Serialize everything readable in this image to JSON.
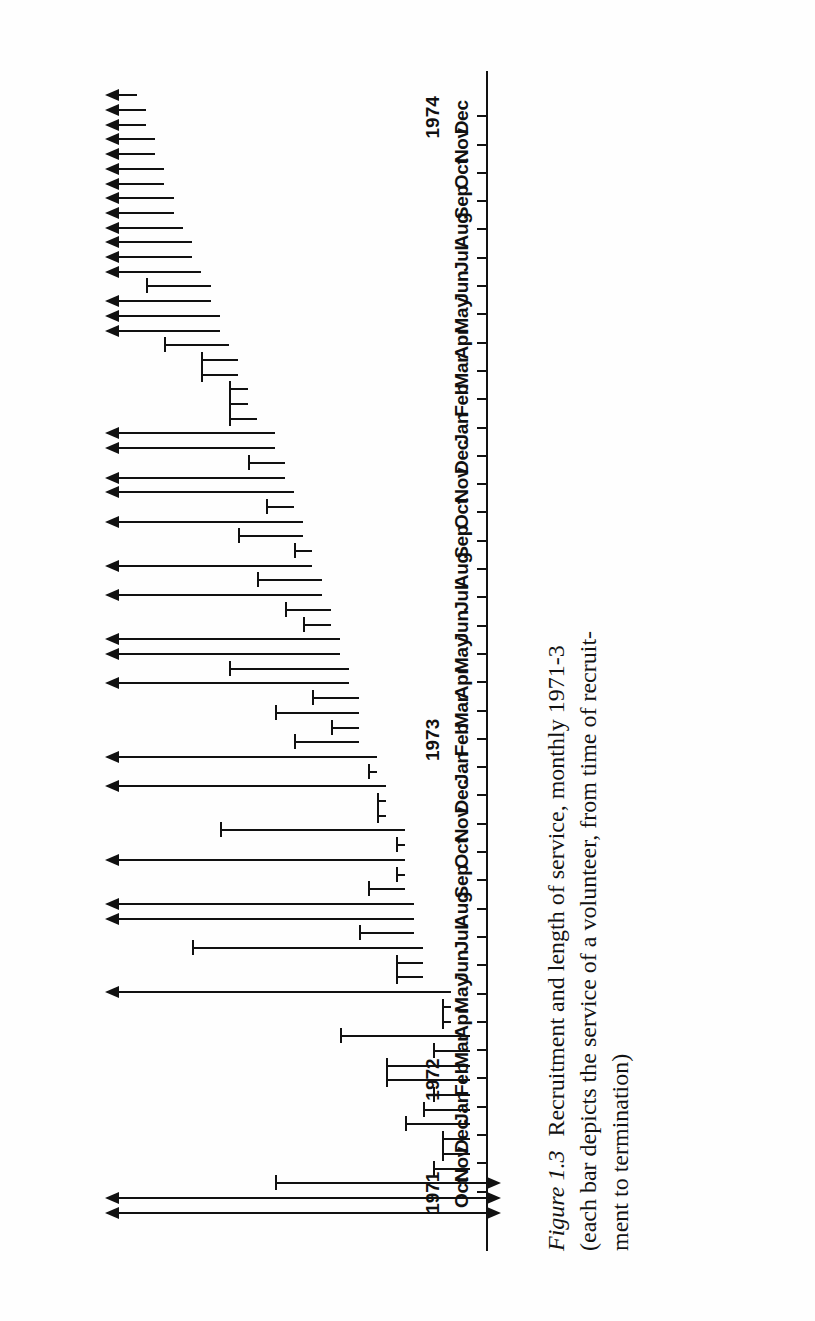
{
  "figure": {
    "caption_label": "Figure 1.3",
    "caption_line1": "Recruitment and length of service, monthly 1971-3",
    "caption_line2": "(each bar depicts the service of a volunteer, from time of recruit-",
    "caption_line3": "ment to termination)"
  },
  "chart_data": {
    "type": "bar",
    "title": "Recruitment and length of service, monthly 1971-3",
    "subtitle": "(each bar depicts the service of a volunteer, from time of recruitment to termination)",
    "orientation": "horizontal-time-axis-rotated",
    "xlabel": "",
    "ylabel": "",
    "grid": false,
    "legend": null,
    "axis_months": [
      "Oct",
      "Nov",
      "Dec",
      "Jan",
      "Feb",
      "Mar",
      "Apr",
      "May",
      "Jun",
      "Jul",
      "Aug",
      "Sep",
      "Oct",
      "Nov",
      "Dec",
      "Jan",
      "Feb",
      "Mar",
      "Apr",
      "May",
      "Jun",
      "Jul",
      "Aug",
      "Sep",
      "Oct",
      "Nov",
      "Dec",
      "Jan",
      "Feb",
      "Mar",
      "Apr",
      "May",
      "Jun",
      "Jul",
      "Aug",
      "Sep",
      "Oct",
      "Nov",
      "Dec"
    ],
    "axis_years": [
      {
        "label": "1971",
        "month_index": 0
      },
      {
        "label": "1972",
        "month_index": 4
      },
      {
        "label": "1973",
        "month_index": 16
      },
      {
        "label": "1974",
        "month_index": 38
      }
    ],
    "axis_range_months": [
      0,
      38
    ],
    "units": "months from Oct 1971",
    "censored_marker": "arrowhead",
    "terminated_marker": "cap-bar",
    "bars": [
      {
        "index": 1,
        "start": -1,
        "end": 39,
        "start_censored": true,
        "end_censored": true
      },
      {
        "index": 2,
        "start": -1,
        "end": 39,
        "start_censored": true,
        "end_censored": true
      },
      {
        "index": 3,
        "start": -1,
        "end": 22,
        "start_censored": true,
        "end_censored": false
      },
      {
        "index": 4,
        "start": 1,
        "end": 5,
        "start_censored": false,
        "end_censored": false
      },
      {
        "index": 5,
        "start": 1,
        "end": 4,
        "start_censored": false,
        "end_censored": false
      },
      {
        "index": 6,
        "start": 1,
        "end": 4,
        "start_censored": false,
        "end_censored": false
      },
      {
        "index": 7,
        "start": 1,
        "end": 8,
        "start_censored": false,
        "end_censored": false
      },
      {
        "index": 8,
        "start": 1,
        "end": 6,
        "start_censored": false,
        "end_censored": false
      },
      {
        "index": 9,
        "start": 1,
        "end": 5,
        "start_censored": false,
        "end_censored": false
      },
      {
        "index": 10,
        "start": 1,
        "end": 10,
        "start_censored": false,
        "end_censored": false
      },
      {
        "index": 11,
        "start": 1,
        "end": 10,
        "start_censored": false,
        "end_censored": false
      },
      {
        "index": 12,
        "start": 1,
        "end": 5,
        "start_censored": false,
        "end_censored": false
      },
      {
        "index": 13,
        "start": 1,
        "end": 15,
        "start_censored": false,
        "end_censored": false
      },
      {
        "index": 14,
        "start": 3,
        "end": 4,
        "start_censored": false,
        "end_censored": false
      },
      {
        "index": 15,
        "start": 3,
        "end": 4,
        "start_censored": false,
        "end_censored": false
      },
      {
        "index": 16,
        "start": 3,
        "end": 39,
        "start_censored": false,
        "end_censored": true
      },
      {
        "index": 17,
        "start": 6,
        "end": 9,
        "start_censored": false,
        "end_censored": false
      },
      {
        "index": 18,
        "start": 6,
        "end": 9,
        "start_censored": false,
        "end_censored": false
      },
      {
        "index": 19,
        "start": 6,
        "end": 31,
        "start_censored": false,
        "end_censored": false
      },
      {
        "index": 20,
        "start": 7,
        "end": 13,
        "start_censored": false,
        "end_censored": false
      },
      {
        "index": 21,
        "start": 7,
        "end": 39,
        "start_censored": false,
        "end_censored": true
      },
      {
        "index": 22,
        "start": 7,
        "end": 39,
        "start_censored": false,
        "end_censored": true
      },
      {
        "index": 23,
        "start": 8,
        "end": 12,
        "start_censored": false,
        "end_censored": false
      },
      {
        "index": 24,
        "start": 8,
        "end": 9,
        "start_censored": false,
        "end_censored": false
      },
      {
        "index": 25,
        "start": 8,
        "end": 39,
        "start_censored": false,
        "end_censored": true
      },
      {
        "index": 26,
        "start": 8,
        "end": 9,
        "start_censored": false,
        "end_censored": false
      },
      {
        "index": 27,
        "start": 8,
        "end": 28,
        "start_censored": false,
        "end_censored": false
      },
      {
        "index": 28,
        "start": 10,
        "end": 11,
        "start_censored": false,
        "end_censored": false
      },
      {
        "index": 29,
        "start": 10,
        "end": 11,
        "start_censored": false,
        "end_censored": false
      },
      {
        "index": 30,
        "start": 10,
        "end": 39,
        "start_censored": false,
        "end_censored": true
      },
      {
        "index": 31,
        "start": 11,
        "end": 12,
        "start_censored": false,
        "end_censored": false
      },
      {
        "index": 32,
        "start": 11,
        "end": 39,
        "start_censored": false,
        "end_censored": true
      },
      {
        "index": 33,
        "start": 13,
        "end": 20,
        "start_censored": false,
        "end_censored": false
      },
      {
        "index": 34,
        "start": 13,
        "end": 16,
        "start_censored": false,
        "end_censored": false
      },
      {
        "index": 35,
        "start": 13,
        "end": 22,
        "start_censored": false,
        "end_censored": false
      },
      {
        "index": 36,
        "start": 13,
        "end": 18,
        "start_censored": false,
        "end_censored": false
      },
      {
        "index": 37,
        "start": 14,
        "end": 39,
        "start_censored": false,
        "end_censored": true
      },
      {
        "index": 38,
        "start": 14,
        "end": 27,
        "start_censored": false,
        "end_censored": false
      },
      {
        "index": 39,
        "start": 15,
        "end": 39,
        "start_censored": false,
        "end_censored": true
      },
      {
        "index": 40,
        "start": 15,
        "end": 39,
        "start_censored": false,
        "end_censored": true
      },
      {
        "index": 41,
        "start": 16,
        "end": 19,
        "start_censored": false,
        "end_censored": false
      },
      {
        "index": 42,
        "start": 16,
        "end": 21,
        "start_censored": false,
        "end_censored": false
      },
      {
        "index": 43,
        "start": 17,
        "end": 39,
        "start_censored": false,
        "end_censored": true
      },
      {
        "index": 44,
        "start": 17,
        "end": 24,
        "start_censored": false,
        "end_censored": false
      },
      {
        "index": 45,
        "start": 18,
        "end": 39,
        "start_censored": false,
        "end_censored": true
      },
      {
        "index": 46,
        "start": 18,
        "end": 20,
        "start_censored": false,
        "end_censored": false
      },
      {
        "index": 47,
        "start": 19,
        "end": 26,
        "start_censored": false,
        "end_censored": false
      },
      {
        "index": 48,
        "start": 19,
        "end": 39,
        "start_censored": false,
        "end_censored": true
      },
      {
        "index": 49,
        "start": 20,
        "end": 23,
        "start_censored": false,
        "end_censored": false
      },
      {
        "index": 50,
        "start": 20,
        "end": 39,
        "start_censored": false,
        "end_censored": true
      },
      {
        "index": 51,
        "start": 21,
        "end": 39,
        "start_censored": false,
        "end_censored": true
      },
      {
        "index": 52,
        "start": 21,
        "end": 25,
        "start_censored": false,
        "end_censored": false
      },
      {
        "index": 53,
        "start": 22,
        "end": 39,
        "start_censored": false,
        "end_censored": true
      },
      {
        "index": 54,
        "start": 22,
        "end": 39,
        "start_censored": false,
        "end_censored": true
      },
      {
        "index": 55,
        "start": 24,
        "end": 27,
        "start_censored": false,
        "end_censored": false
      },
      {
        "index": 56,
        "start": 25,
        "end": 27,
        "start_censored": false,
        "end_censored": false
      },
      {
        "index": 57,
        "start": 25,
        "end": 27,
        "start_censored": false,
        "end_censored": false
      },
      {
        "index": 58,
        "start": 26,
        "end": 30,
        "start_censored": false,
        "end_censored": false
      },
      {
        "index": 59,
        "start": 26,
        "end": 30,
        "start_censored": false,
        "end_censored": false
      },
      {
        "index": 60,
        "start": 27,
        "end": 34,
        "start_censored": false,
        "end_censored": false
      },
      {
        "index": 61,
        "start": 28,
        "end": 39,
        "start_censored": false,
        "end_censored": true
      },
      {
        "index": 62,
        "start": 28,
        "end": 39,
        "start_censored": false,
        "end_censored": true
      },
      {
        "index": 63,
        "start": 29,
        "end": 39,
        "start_censored": false,
        "end_censored": true
      },
      {
        "index": 64,
        "start": 29,
        "end": 36,
        "start_censored": false,
        "end_censored": false
      },
      {
        "index": 65,
        "start": 30,
        "end": 39,
        "start_censored": false,
        "end_censored": true
      },
      {
        "index": 66,
        "start": 31,
        "end": 39,
        "start_censored": false,
        "end_censored": true
      },
      {
        "index": 67,
        "start": 31,
        "end": 39,
        "start_censored": false,
        "end_censored": true
      },
      {
        "index": 68,
        "start": 32,
        "end": 39,
        "start_censored": false,
        "end_censored": true
      },
      {
        "index": 69,
        "start": 33,
        "end": 39,
        "start_censored": false,
        "end_censored": true
      },
      {
        "index": 70,
        "start": 33,
        "end": 39,
        "start_censored": false,
        "end_censored": true
      },
      {
        "index": 71,
        "start": 34,
        "end": 39,
        "start_censored": false,
        "end_censored": true
      },
      {
        "index": 72,
        "start": 34,
        "end": 39,
        "start_censored": false,
        "end_censored": true
      },
      {
        "index": 73,
        "start": 35,
        "end": 39,
        "start_censored": false,
        "end_censored": true
      },
      {
        "index": 74,
        "start": 35,
        "end": 39,
        "start_censored": false,
        "end_censored": true
      },
      {
        "index": 75,
        "start": 36,
        "end": 39,
        "start_censored": false,
        "end_censored": true
      },
      {
        "index": 76,
        "start": 36,
        "end": 39,
        "start_censored": false,
        "end_censored": true
      },
      {
        "index": 77,
        "start": 37,
        "end": 39,
        "start_censored": false,
        "end_censored": true
      }
    ]
  }
}
